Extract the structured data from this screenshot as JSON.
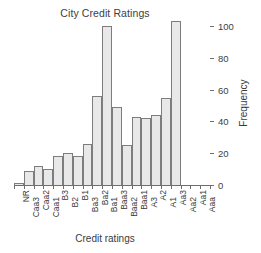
{
  "chart_data": {
    "type": "bar",
    "title": "City Credit Ratings",
    "xlabel": "Credit ratings",
    "ylabel": "Frequency",
    "categories": [
      "NR",
      "Caa3",
      "Caa2",
      "Caa1",
      "B3",
      "B2",
      "B1",
      "Ba3",
      "Ba2",
      "Ba1",
      "Baa3",
      "Baa2",
      "Baa1",
      "A3",
      "A2",
      "A1",
      "Aa3",
      "Aa2",
      "Aa1",
      "Aaa"
    ],
    "values": [
      1,
      9,
      12,
      10,
      18,
      20,
      18,
      26,
      56,
      100,
      49,
      25,
      43,
      42,
      44,
      55,
      103,
      0,
      0,
      0
    ],
    "series": [
      {
        "name": "Frequency",
        "values": [
          1,
          9,
          12,
          10,
          18,
          20,
          18,
          26,
          56,
          100,
          49,
          25,
          43,
          42,
          44,
          55,
          103,
          0,
          0,
          0
        ]
      }
    ],
    "ylim": [
      0,
      105
    ],
    "yticks": [
      0,
      20,
      40,
      60,
      80,
      100
    ],
    "ytick_labels": [
      "0",
      "20",
      "40",
      "60",
      "80",
      "100"
    ],
    "grid": false,
    "legend": false,
    "legend_position": "none",
    "y_axis_position": "right",
    "bar_fill_color": "#e8e8e8",
    "bar_edge_color": "#7d7d7d",
    "axis_color": "#6e6e6e",
    "text_color": "#3a3a3a",
    "background_color": "#ffffff"
  }
}
